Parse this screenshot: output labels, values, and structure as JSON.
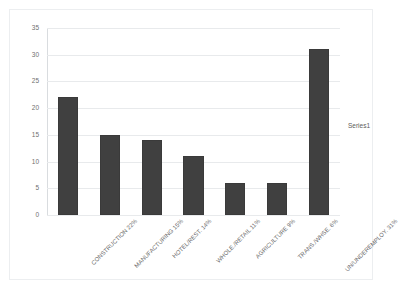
{
  "chart_data": {
    "type": "bar",
    "title": "",
    "xlabel": "",
    "ylabel": "",
    "ylim": [
      0,
      35
    ],
    "grid": true,
    "legend_position": "right",
    "categories": [
      "CONSTRUCTION 22%",
      "MANUFACTURING 15%",
      "HOTEL/REST. 14%",
      "WHOLE./RETAIL 11%",
      "AGRICULTURE 9%",
      "TRANS./WHSE. 6%",
      "UN/UNDEREMPLOY. 31%"
    ],
    "values": [
      22,
      15,
      14,
      11,
      6,
      6,
      31
    ],
    "series": [
      {
        "name": "Series1",
        "values": [
          22,
          15,
          14,
          11,
          6,
          6,
          31
        ]
      }
    ],
    "y_ticks": [
      0,
      5,
      10,
      15,
      20,
      25,
      30,
      35
    ],
    "bar_color": "#404040",
    "gridline_color": "#e8eaec",
    "plot_background": "#ffffff"
  },
  "legend": {
    "entries": [
      "Series1"
    ]
  }
}
